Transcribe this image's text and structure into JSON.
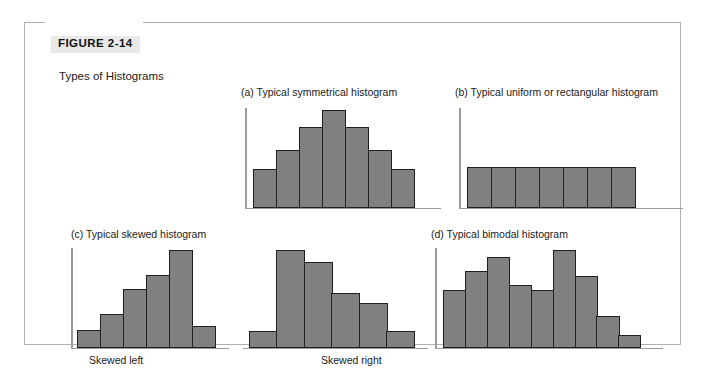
{
  "figure": {
    "label": "FIGURE 2-14",
    "subtitle": "Types of Histograms"
  },
  "colors": {
    "bar_fill": "#808080",
    "bar_stroke": "#1f1f1f",
    "axis": "#9a9a9a",
    "frame": "#b0b0b0",
    "label_badge": "#e9e9e9",
    "page_background": "#ffffff"
  },
  "panels": [
    {
      "key": "a",
      "title": "(a)  Typical symmetrical histogram"
    },
    {
      "key": "b",
      "title": "(b)  Typical uniform or rectangular histogram"
    },
    {
      "key": "c",
      "title": "(c)  Typical skewed histogram"
    },
    {
      "key": "d",
      "title": "(d)  Typical bimodal histogram"
    }
  ],
  "captions": {
    "skewed_left": "Skewed left",
    "skewed_right": "Skewed right"
  },
  "chart_data": [
    {
      "id": "symmetrical",
      "type": "bar",
      "title": "(a)  Typical symmetrical histogram",
      "xlabel": "",
      "ylabel": "",
      "grid": false,
      "legend": "none",
      "axis_shown": [
        "y",
        "x"
      ],
      "tick_labels": [],
      "categories": [
        "1",
        "2",
        "3",
        "4",
        "5",
        "6",
        "7"
      ],
      "values": [
        38,
        57,
        80,
        97,
        80,
        57,
        38
      ],
      "ylim": [
        0,
        100
      ]
    },
    {
      "id": "uniform",
      "type": "bar",
      "title": "(b)  Typical uniform or rectangular histogram",
      "xlabel": "",
      "ylabel": "",
      "grid": false,
      "legend": "none",
      "axis_shown": [
        "y",
        "x"
      ],
      "tick_labels": [],
      "categories": [
        "1",
        "2",
        "3",
        "4",
        "5",
        "6",
        "7"
      ],
      "values": [
        40,
        40,
        40,
        40,
        40,
        40,
        40
      ],
      "ylim": [
        0,
        100
      ]
    },
    {
      "id": "skewed-left",
      "type": "bar",
      "title": "(c)  Typical skewed histogram",
      "caption": "Skewed left",
      "xlabel": "",
      "ylabel": "",
      "grid": false,
      "legend": "none",
      "axis_shown": [
        "y",
        "x"
      ],
      "tick_labels": [],
      "categories": [
        "1",
        "2",
        "3",
        "4",
        "5",
        "6"
      ],
      "values": [
        17,
        33,
        58,
        72,
        97,
        21
      ],
      "ylim": [
        0,
        100
      ]
    },
    {
      "id": "skewed-right",
      "type": "bar",
      "title": "(c)  Typical skewed histogram",
      "caption": "Skewed right",
      "xlabel": "",
      "ylabel": "",
      "grid": false,
      "legend": "none",
      "axis_shown": [
        "x"
      ],
      "tick_labels": [],
      "categories": [
        "1",
        "2",
        "3",
        "4",
        "5",
        "6"
      ],
      "values": [
        16,
        97,
        85,
        54,
        44,
        16
      ],
      "ylim": [
        0,
        100
      ]
    },
    {
      "id": "bimodal",
      "type": "bar",
      "title": "(d)  Typical bimodal histogram",
      "xlabel": "",
      "ylabel": "",
      "grid": false,
      "legend": "none",
      "axis_shown": [
        "y",
        "x"
      ],
      "tick_labels": [],
      "categories": [
        "1",
        "2",
        "3",
        "4",
        "5",
        "6",
        "7",
        "8",
        "9"
      ],
      "values": [
        57,
        76,
        90,
        62,
        57,
        97,
        71,
        31,
        12
      ],
      "ylim": [
        0,
        100
      ]
    }
  ]
}
